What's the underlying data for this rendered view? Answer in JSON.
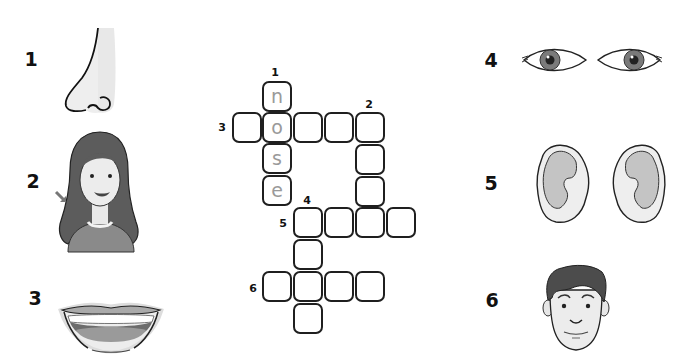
{
  "worksheet": {
    "title": "",
    "instructions": "",
    "pictures": [
      {
        "number": "1",
        "label": "nose-picture",
        "icon": "nose-icon"
      },
      {
        "number": "2",
        "label": "hair-picture",
        "icon": "girl-hair-icon"
      },
      {
        "number": "3",
        "label": "mouth-picture",
        "icon": "mouth-icon"
      },
      {
        "number": "4",
        "label": "eyes-picture",
        "icon": "eyes-icon"
      },
      {
        "number": "5",
        "label": "ears-picture",
        "icon": "ears-icon"
      },
      {
        "number": "6",
        "label": "head-picture",
        "icon": "head-icon"
      }
    ]
  },
  "crossword": {
    "cell_border_color": "#1f1f1f",
    "letter_color": "#9a9a9a",
    "clue_numbers": [
      "1",
      "2",
      "3",
      "4",
      "5",
      "6"
    ],
    "words": [
      {
        "number": "1",
        "direction": "down",
        "length": 4,
        "filled": "nose"
      },
      {
        "number": "2",
        "direction": "down",
        "length": 4,
        "filled": ""
      },
      {
        "number": "3",
        "direction": "across",
        "length": 5,
        "filled": ""
      },
      {
        "number": "4",
        "direction": "down",
        "length": 4,
        "filled": ""
      },
      {
        "number": "5",
        "direction": "across",
        "length": 4,
        "filled": ""
      },
      {
        "number": "6",
        "direction": "across",
        "length": 4,
        "filled": ""
      }
    ],
    "cells": [
      {
        "col": 1,
        "row": 0,
        "letter": "n"
      },
      {
        "col": 0,
        "row": 1,
        "letter": ""
      },
      {
        "col": 1,
        "row": 1,
        "letter": "o"
      },
      {
        "col": 2,
        "row": 1,
        "letter": ""
      },
      {
        "col": 3,
        "row": 1,
        "letter": ""
      },
      {
        "col": 4,
        "row": 1,
        "letter": ""
      },
      {
        "col": 1,
        "row": 2,
        "letter": "s"
      },
      {
        "col": 4,
        "row": 2,
        "letter": ""
      },
      {
        "col": 1,
        "row": 3,
        "letter": "e"
      },
      {
        "col": 4,
        "row": 3,
        "letter": ""
      },
      {
        "col": 2,
        "row": 4,
        "letter": ""
      },
      {
        "col": 3,
        "row": 4,
        "letter": ""
      },
      {
        "col": 4,
        "row": 4,
        "letter": ""
      },
      {
        "col": 5,
        "row": 4,
        "letter": ""
      },
      {
        "col": 2,
        "row": 5,
        "letter": ""
      },
      {
        "col": 1,
        "row": 6,
        "letter": ""
      },
      {
        "col": 2,
        "row": 6,
        "letter": ""
      },
      {
        "col": 3,
        "row": 6,
        "letter": ""
      },
      {
        "col": 4,
        "row": 6,
        "letter": ""
      },
      {
        "col": 2,
        "row": 7,
        "letter": ""
      }
    ]
  }
}
